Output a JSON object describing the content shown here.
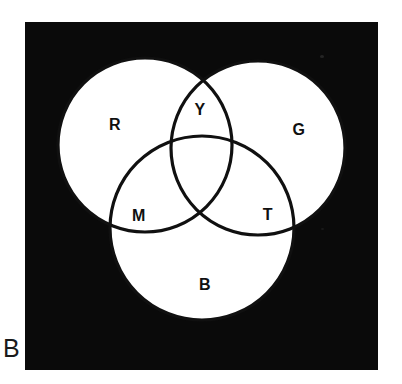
{
  "figure": {
    "panel_caption": "B",
    "type": "venn-diagram-3-set",
    "background_color": "#ffffff",
    "plate_color": "#0a0a0a",
    "circle_fill_color": "#ffffff",
    "outline_color": "#101010"
  },
  "diagram_data": {
    "type": "venn",
    "sets": [
      {
        "id": "red",
        "label": "R",
        "cx": 120,
        "cy": 123,
        "r": 87,
        "label_x": 90,
        "label_y": 103
      },
      {
        "id": "green",
        "label": "G",
        "cx": 233,
        "cy": 126,
        "r": 87,
        "label_x": 274,
        "label_y": 108
      },
      {
        "id": "blue",
        "label": "B",
        "cx": 177,
        "cy": 206,
        "r": 92,
        "label_x": 180,
        "label_y": 263
      }
    ],
    "intersections": [
      {
        "id": "red-green",
        "label": "Y",
        "label_x": 175,
        "label_y": 88
      },
      {
        "id": "red-blue",
        "label": "M",
        "label_x": 114,
        "label_y": 194
      },
      {
        "id": "green-blue",
        "label": "T",
        "label_x": 243,
        "label_y": 193
      }
    ],
    "labels": [
      "R",
      "G",
      "B",
      "Y",
      "M",
      "T"
    ]
  }
}
